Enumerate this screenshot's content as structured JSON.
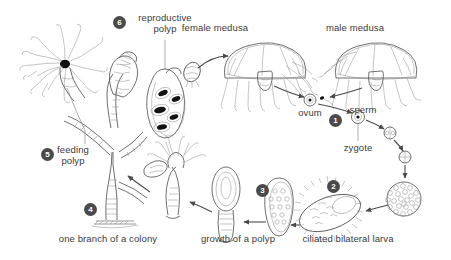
{
  "figure": {
    "background_color": "#ffffff",
    "text_color": "#3a3a3a",
    "marker_color": "#4a4a4a",
    "ink_color": "#6b6b6b"
  },
  "labels": {
    "reproductive_polyp": "reproductive\npolyp",
    "reproductive_polyp_line1": "reproductive",
    "reproductive_polyp_line2": "polyp",
    "female_medusa": "female medusa",
    "male_medusa": "male medusa",
    "ovum": "ovum",
    "sperm": "sperm",
    "zygote": "zygote",
    "feeding_polyp_line1": "feeding",
    "feeding_polyp_line2": "polyp",
    "one_branch_of_a_colony": "one branch of a colony",
    "growth_of_a_polyp": "growth of a polyp",
    "ciliated_bilateral_larva": "ciliated bilateral larva"
  },
  "markers": [
    {
      "id": "marker-1",
      "number": "1",
      "x": 329,
      "y": 114,
      "refers_to": "fertilization"
    },
    {
      "id": "marker-2",
      "number": "2",
      "x": 327,
      "y": 180,
      "refers_to": "ciliated bilateral larva"
    },
    {
      "id": "marker-3",
      "number": "3",
      "x": 256,
      "y": 184,
      "refers_to": "growth of a polyp"
    },
    {
      "id": "marker-4",
      "number": "4",
      "x": 84,
      "y": 203,
      "refers_to": "one branch of a colony"
    },
    {
      "id": "marker-5",
      "number": "5",
      "x": 41,
      "y": 148,
      "refers_to": "feeding polyp"
    },
    {
      "id": "marker-6",
      "number": "6",
      "x": 113,
      "y": 16,
      "refers_to": "reproductive polyp"
    }
  ],
  "stages": [
    {
      "name": "feeding-polyp",
      "label": "feeding polyp"
    },
    {
      "name": "reproductive-polyp",
      "label": "reproductive polyp"
    },
    {
      "name": "female-medusa",
      "label": "female medusa"
    },
    {
      "name": "male-medusa",
      "label": "male medusa"
    },
    {
      "name": "ovum",
      "label": "ovum"
    },
    {
      "name": "sperm",
      "label": "sperm"
    },
    {
      "name": "zygote",
      "label": "zygote"
    },
    {
      "name": "two-cell-stage",
      "label": ""
    },
    {
      "name": "four-cell-stage",
      "label": ""
    },
    {
      "name": "blastula",
      "label": ""
    },
    {
      "name": "ciliated-bilateral-larva",
      "label": "ciliated bilateral larva"
    },
    {
      "name": "settled-larva",
      "label": ""
    },
    {
      "name": "young-polyp",
      "label": "growth of a polyp"
    },
    {
      "name": "colony-branch",
      "label": "one branch of a colony"
    }
  ]
}
